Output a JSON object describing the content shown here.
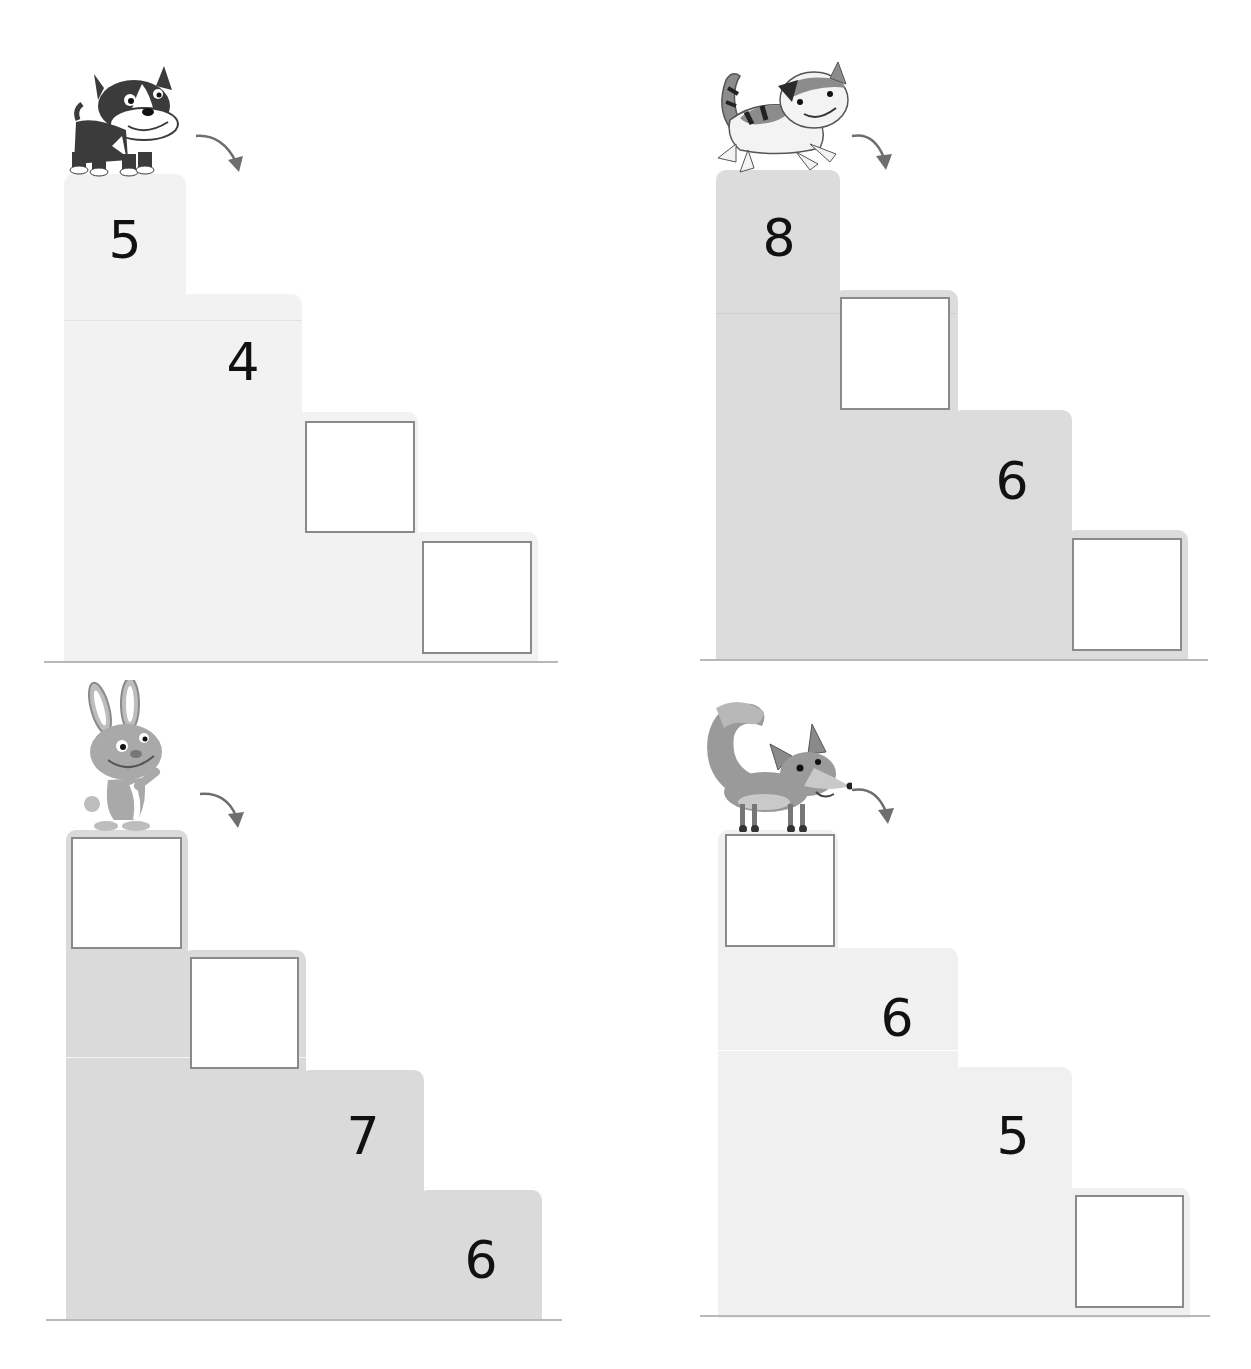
{
  "worksheet": {
    "type": "count-down staircases",
    "colors": {
      "step_light": "#f1f1f1",
      "step_mid": "#dedede",
      "step_dark": "#d9d9d9",
      "box_border": "#8a8a8a",
      "ground": "#b8b8b8",
      "arrow": "#6e6e6e",
      "digit": "#111111"
    },
    "puzzles": [
      {
        "animal": "dog",
        "steps": [
          {
            "value": "5",
            "blank": false
          },
          {
            "value": "4",
            "blank": false
          },
          {
            "value": "",
            "blank": true
          },
          {
            "value": "",
            "blank": true
          }
        ]
      },
      {
        "animal": "cat",
        "steps": [
          {
            "value": "8",
            "blank": false
          },
          {
            "value": "",
            "blank": true
          },
          {
            "value": "6",
            "blank": false
          },
          {
            "value": "",
            "blank": true
          }
        ]
      },
      {
        "animal": "rabbit",
        "steps": [
          {
            "value": "",
            "blank": true
          },
          {
            "value": "",
            "blank": true
          },
          {
            "value": "7",
            "blank": false
          },
          {
            "value": "6",
            "blank": false
          }
        ]
      },
      {
        "animal": "fox",
        "steps": [
          {
            "value": "",
            "blank": true
          },
          {
            "value": "6",
            "blank": false
          },
          {
            "value": "5",
            "blank": false
          },
          {
            "value": "",
            "blank": true
          }
        ]
      }
    ]
  }
}
